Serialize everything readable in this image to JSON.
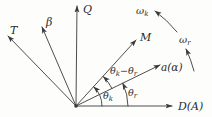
{
  "colors": {
    "line": "#3a3a3a",
    "text": "#2a2a2a",
    "background": "#fdfdfc"
  },
  "labels": {
    "axis_q": "Q",
    "axis_t": "T",
    "axis_beta": "β",
    "axis_m": "M",
    "axis_a": "a(α)",
    "axis_d": "D(A)",
    "theta": "θ",
    "omega": "ω",
    "sub_k": "k",
    "sub_r": "r",
    "minus": "−"
  }
}
